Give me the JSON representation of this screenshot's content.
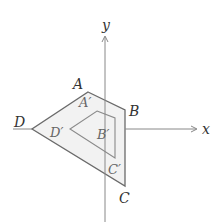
{
  "axes": {
    "x_label": "x",
    "y_label": "y",
    "origin": [
      105,
      129
    ],
    "x_range_px": [
      13,
      197
    ],
    "y_range_px": [
      36,
      222
    ]
  },
  "outer_polygon": {
    "vertices": [
      {
        "name": "A",
        "pos": [
          88,
          92
        ]
      },
      {
        "name": "B",
        "pos": [
          125,
          110
        ]
      },
      {
        "name": "C",
        "pos": [
          125,
          186
        ]
      },
      {
        "name": "D",
        "pos": [
          32,
          129
        ]
      }
    ],
    "fill": "#f2f2f2",
    "stroke": "#666666"
  },
  "inner_polygon": {
    "vertices": [
      {
        "name": "A′",
        "pos": [
          97,
          111
        ]
      },
      {
        "name": "B′",
        "pos": [
          115,
          118
        ]
      },
      {
        "name": "C′",
        "pos": [
          115,
          158
        ]
      },
      {
        "name": "D′",
        "pos": [
          70,
          129
        ]
      }
    ],
    "stroke": "#888888"
  },
  "labels": {
    "A": "A",
    "B": "B",
    "C": "C",
    "D": "D",
    "A_prime": "A′",
    "B_prime": "B′",
    "C_prime": "C′",
    "D_prime": "D′"
  }
}
